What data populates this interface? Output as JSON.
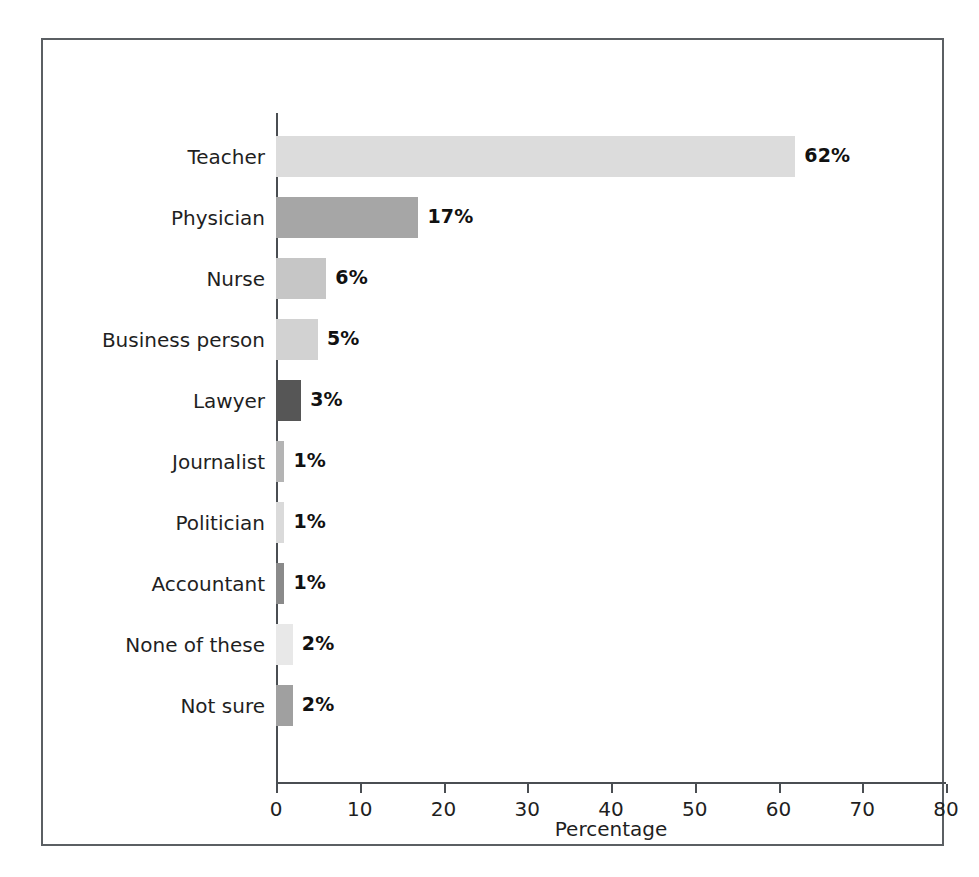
{
  "chart_data": {
    "type": "bar",
    "orientation": "horizontal",
    "title": "",
    "xlabel": "Percentage",
    "ylabel": "",
    "xlim": [
      0,
      80
    ],
    "xticks": [
      0,
      10,
      20,
      30,
      40,
      50,
      60,
      70,
      80
    ],
    "xtick_labels": [
      "0",
      "10",
      "20",
      "30",
      "40",
      "50",
      "60",
      "70",
      "80"
    ],
    "grid": false,
    "legend": false,
    "categories": [
      "Teacher",
      "Physician",
      "Nurse",
      "Business person",
      "Lawyer",
      "Journalist",
      "Politician",
      "Accountant",
      "None of these",
      "Not sure"
    ],
    "values": [
      62,
      17,
      6,
      5,
      3,
      1,
      1,
      1,
      2,
      2
    ],
    "value_labels": [
      "62%",
      "17%",
      "6%",
      "5%",
      "3%",
      "1%",
      "1%",
      "1%",
      "2%",
      "2%"
    ],
    "bar_colors": [
      "#dcdcdc",
      "#a6a6a6",
      "#c6c6c6",
      "#d2d2d2",
      "#565656",
      "#b4b4b4",
      "#dadada",
      "#8a8a8a",
      "#e8e8e8",
      "#a0a0a0"
    ],
    "bars": [
      {
        "category": "Teacher",
        "value": 62,
        "label": "62%",
        "color": "#dcdcdc"
      },
      {
        "category": "Physician",
        "value": 17,
        "label": "17%",
        "color": "#a6a6a6"
      },
      {
        "category": "Nurse",
        "value": 6,
        "label": "6%",
        "color": "#c6c6c6"
      },
      {
        "category": "Business person",
        "value": 5,
        "label": "5%",
        "color": "#d2d2d2"
      },
      {
        "category": "Lawyer",
        "value": 3,
        "label": "3%",
        "color": "#565656"
      },
      {
        "category": "Journalist",
        "value": 1,
        "label": "1%",
        "color": "#b4b4b4"
      },
      {
        "category": "Politician",
        "value": 1,
        "label": "1%",
        "color": "#dadada"
      },
      {
        "category": "Accountant",
        "value": 1,
        "label": "1%",
        "color": "#8a8a8a"
      },
      {
        "category": "None of these",
        "value": 2,
        "label": "2%",
        "color": "#e8e8e8"
      },
      {
        "category": "Not sure",
        "value": 2,
        "label": "2%",
        "color": "#a0a0a0"
      }
    ],
    "axis_color": "#4a4e52",
    "frame_color": "#5b5f63",
    "background_color": "#ffffff"
  }
}
